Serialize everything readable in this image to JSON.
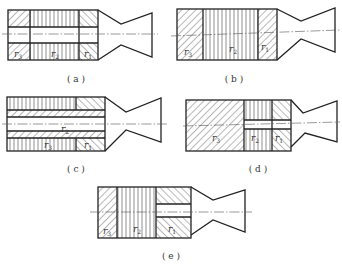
{
  "figure": {
    "colors": {
      "line": "#222222",
      "background": "#ffffff",
      "text": "#333333"
    },
    "panels": [
      {
        "id": "a",
        "caption": "( a )",
        "labels": {
          "r3": "r",
          "r3_sub": "3",
          "r2": "r",
          "r2_sub": "2",
          "r1": "r",
          "r1_sub": "1"
        },
        "zones": [
          "r3: diagonal hatch, aft-left",
          "r2: vertical lines, middle",
          "r1: crosshatch, near nozzle"
        ],
        "central_bore": true
      },
      {
        "id": "b",
        "caption": "( b )",
        "labels": {
          "r3": "r",
          "r3_sub": "3",
          "r2": "r",
          "r2_sub": "2",
          "r1": "r",
          "r1_sub": "1"
        },
        "zones": [
          "r3: diagonal hatch",
          "r2: vertical lines",
          "r1: diagonal hatch"
        ],
        "central_bore": false
      },
      {
        "id": "c",
        "caption": "( c )",
        "labels": {
          "r3": "r",
          "r3_sub": "3",
          "r2": "r",
          "r2_sub": "2",
          "r1": "r",
          "r1_sub": "1"
        },
        "zones": [
          "r3: vertical lines, outer layer",
          "r2: diagonal hatch, inner liner around bore",
          "r1: crosshatch, near nozzle"
        ],
        "central_bore": true
      },
      {
        "id": "d",
        "caption": "( d )",
        "labels": {
          "r3": "r",
          "r3_sub": "3",
          "r2": "r",
          "r2_sub": "2",
          "r1": "r",
          "r1_sub": "1"
        },
        "zones": [
          "r3: diagonal hatch, large left",
          "r2: vertical lines with bore",
          "r1: crosshatch with bore"
        ],
        "central_bore": true
      },
      {
        "id": "e",
        "caption": "( e )",
        "labels": {
          "r3": "r",
          "r3_sub": "3",
          "r2": "r",
          "r2_sub": "2",
          "r1": "r",
          "r1_sub": "1"
        },
        "zones": [
          "r3: diagonal hatch",
          "r2: vertical lines",
          "r1: diagonal hatch with bore"
        ],
        "central_bore": true
      }
    ]
  }
}
